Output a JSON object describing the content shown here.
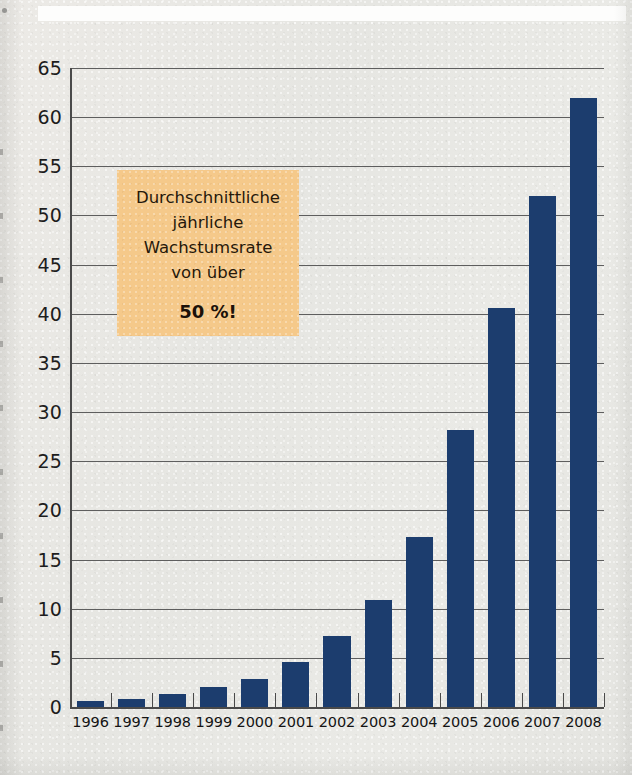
{
  "figure": {
    "background_color": "#e8e8e4",
    "bar_color": "#1c3d6e",
    "callout_color": "#f5c98a",
    "axis_color": "#4a4a4a",
    "gridline_color": "#5e5e5e"
  },
  "callout": {
    "line1": "Durchschnittliche",
    "line2": "jährliche",
    "line3": "Wachstumsrate",
    "line4": "von über",
    "emphasis": "50 %!"
  },
  "chart_data": {
    "type": "bar",
    "title": "",
    "subtitle": "",
    "xlabel": "",
    "ylabel": "",
    "categories": [
      "1996",
      "1997",
      "1998",
      "1999",
      "2000",
      "2001",
      "2002",
      "2003",
      "2004",
      "2005",
      "2006",
      "2007",
      "2008"
    ],
    "values": [
      0.6,
      0.8,
      1.3,
      2.0,
      2.9,
      4.6,
      7.2,
      10.9,
      17.3,
      28.2,
      40.6,
      52.0,
      62.0
    ],
    "ylim": [
      0,
      65
    ],
    "ytick_labels": [
      "0",
      "5",
      "10",
      "15",
      "20",
      "25",
      "30",
      "35",
      "40",
      "45",
      "50",
      "55",
      "60",
      "65"
    ],
    "ytick_values": [
      0,
      5,
      10,
      15,
      20,
      25,
      30,
      35,
      40,
      45,
      50,
      55,
      60,
      65
    ],
    "grid": true,
    "grid_axis": "y",
    "legend": false,
    "legend_position": "none",
    "annotations": [
      {
        "text": "Durchschnittliche jährliche Wachstumsrate von über 50 %!",
        "style": "callout-box",
        "background": "#f5c98a"
      }
    ]
  }
}
